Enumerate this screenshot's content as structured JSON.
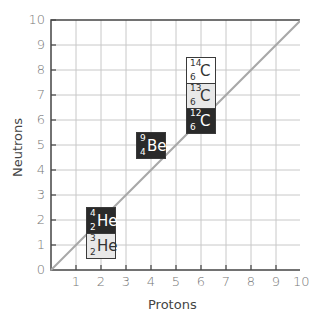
{
  "chart_data": {
    "type": "scatter",
    "title": "",
    "xlabel": "Protons",
    "ylabel": "Neutrons",
    "xlim": [
      0,
      10
    ],
    "ylim": [
      0,
      10
    ],
    "grid": true,
    "x_ticks": [
      "0",
      "1",
      "2",
      "3",
      "4",
      "5",
      "6",
      "7",
      "8",
      "9",
      "10"
    ],
    "y_ticks": [
      "0",
      "1",
      "2",
      "3",
      "4",
      "5",
      "6",
      "7",
      "8",
      "9",
      "10"
    ],
    "reference_line": {
      "label": "N = Z",
      "from": [
        0,
        0
      ],
      "to": [
        10,
        10
      ],
      "color": "#a0a0a0"
    },
    "isotopes": [
      {
        "symbol": "He",
        "mass": "3",
        "z": "2",
        "protons": 2,
        "neutrons": 1,
        "style": "light"
      },
      {
        "symbol": "He",
        "mass": "4",
        "z": "2",
        "protons": 2,
        "neutrons": 2,
        "style": "dark"
      },
      {
        "symbol": "Be",
        "mass": "9",
        "z": "4",
        "protons": 4,
        "neutrons": 5,
        "style": "dark"
      },
      {
        "symbol": "C",
        "mass": "12",
        "z": "6",
        "protons": 6,
        "neutrons": 6,
        "style": "dark"
      },
      {
        "symbol": "C",
        "mass": "13",
        "z": "6",
        "protons": 6,
        "neutrons": 7,
        "style": "light"
      },
      {
        "symbol": "C",
        "mass": "14",
        "z": "6",
        "protons": 6,
        "neutrons": 8,
        "style": "white"
      }
    ]
  },
  "colors": {
    "dark_box": "#2a2a2a",
    "light_box": "#e8e8e8",
    "white_box": "#ffffff",
    "grid": "#c8c8c8",
    "axis": "#444444",
    "diagonal": "#a8a8a8"
  }
}
